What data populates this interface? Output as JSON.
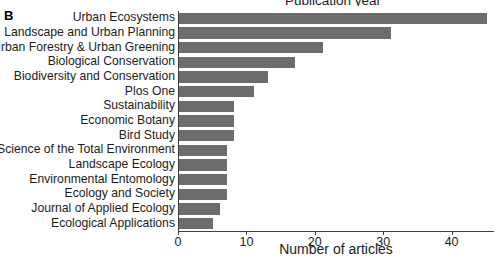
{
  "panel": {
    "letter": "B"
  },
  "chart_data": {
    "type": "bar",
    "orientation": "horizontal",
    "title": "Publication year",
    "xlabel": "Number of articles",
    "ylabel": "",
    "xlim": [
      0,
      46.2
    ],
    "xticks": [
      0,
      10,
      20,
      30,
      40
    ],
    "xtick_labels": [
      "0",
      "10",
      "20",
      "30",
      "40"
    ],
    "grid": false,
    "legend": null,
    "bar_color": "#6d6d6d",
    "axis_color": "#3d3d3d",
    "categories": [
      "Urban Ecosystems",
      "Landscape and Urban Planning",
      "Urban Forestry & Urban Greening",
      "Biological Conservation",
      "Biodiversity and Conservation",
      "Plos One",
      "Sustainability",
      "Economic Botany",
      "Bird Study",
      "Science of the Total Environment",
      "Landscape Ecology",
      "Environmental Entomology",
      "Ecology and Society",
      "Journal of Applied Ecology",
      "Ecological Applications"
    ],
    "values": [
      45,
      31,
      21,
      17,
      13,
      11,
      8,
      8,
      8,
      7,
      7,
      7,
      7,
      6,
      5
    ]
  }
}
